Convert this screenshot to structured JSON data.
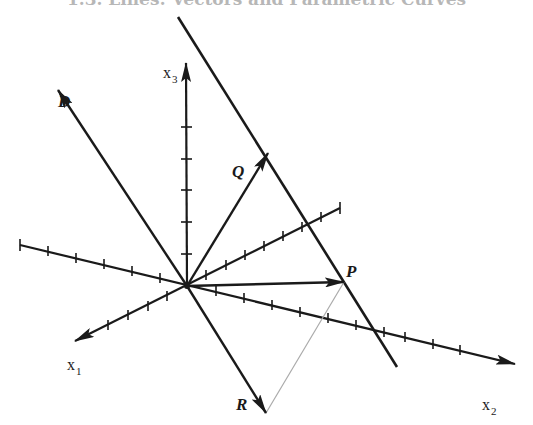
{
  "header": {
    "title": "1.3. Lines: Vectors and Parametric Curves"
  },
  "diagram": {
    "origin": [
      187,
      286
    ],
    "axes": [
      {
        "name": "x1",
        "label": "x",
        "subscript": "1",
        "from": [
          340,
          208
        ],
        "to": [
          75,
          341
        ],
        "label_pos": [
          66,
          370
        ]
      },
      {
        "name": "x2",
        "label": "x",
        "subscript": "2",
        "from": [
          20,
          245
        ],
        "to": [
          515,
          364
        ],
        "label_pos": [
          482,
          410
        ]
      },
      {
        "name": "x3",
        "label": "x",
        "subscript": "3",
        "from": [
          187,
          286
        ],
        "to": [
          186,
          63
        ],
        "label_pos": [
          163,
          78
        ]
      }
    ],
    "vectors": [
      {
        "name": "D",
        "label": "D",
        "to": [
          58,
          90
        ],
        "label_pos": [
          60,
          107
        ]
      },
      {
        "name": "Q",
        "label": "Q",
        "to": [
          268,
          153
        ],
        "label_pos": [
          232,
          177
        ]
      },
      {
        "name": "P",
        "label": "P",
        "to": [
          344,
          282
        ],
        "label_pos": [
          346,
          277
        ]
      },
      {
        "name": "R",
        "label": "R",
        "to": [
          266,
          413
        ],
        "label_pos": [
          236,
          410
        ]
      }
    ],
    "line": {
      "name": "line-through-P-Q",
      "from": [
        178,
        17
      ],
      "to": [
        397,
        367
      ]
    },
    "dotted_segment": {
      "from": [
        344,
        282
      ],
      "to": [
        266,
        413
      ],
      "color": "#aaaaaa"
    },
    "colors": {
      "ink": "#1a1a1a",
      "guide": "#aaaaaa"
    }
  },
  "labels": {
    "D": "D",
    "Q": "Q",
    "P": "P",
    "R": "R",
    "x": "x",
    "sub1": "1",
    "sub2": "2",
    "sub3": "3"
  }
}
